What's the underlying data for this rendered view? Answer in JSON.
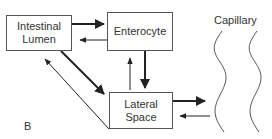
{
  "diagram": {
    "nodes": {
      "lumen": {
        "label_line1": "Intestinal",
        "label_line2": "Lumen"
      },
      "enterocyte": {
        "label": "Enterocyte"
      },
      "lateral": {
        "label_line1": "Lateral",
        "label_line2": "Space"
      },
      "capillary": {
        "label": "Capillary"
      }
    },
    "panel_label": "B",
    "edges": [
      {
        "from": "Intestinal Lumen",
        "to": "Enterocyte",
        "weight": "bold"
      },
      {
        "from": "Enterocyte",
        "to": "Intestinal Lumen",
        "weight": "thin"
      },
      {
        "from": "Enterocyte",
        "to": "Lateral Space",
        "weight": "bold"
      },
      {
        "from": "Lateral Space",
        "to": "Enterocyte",
        "weight": "thin"
      },
      {
        "from": "Intestinal Lumen",
        "to": "Lateral Space",
        "weight": "bold"
      },
      {
        "from": "Lateral Space",
        "to": "Intestinal Lumen",
        "weight": "thin"
      },
      {
        "from": "Lateral Space",
        "to": "Capillary",
        "weight": "bold"
      },
      {
        "from": "Capillary",
        "to": "Lateral Space",
        "weight": "thin"
      }
    ],
    "colors": {
      "line": "#222222",
      "box_border": "#555555"
    }
  }
}
